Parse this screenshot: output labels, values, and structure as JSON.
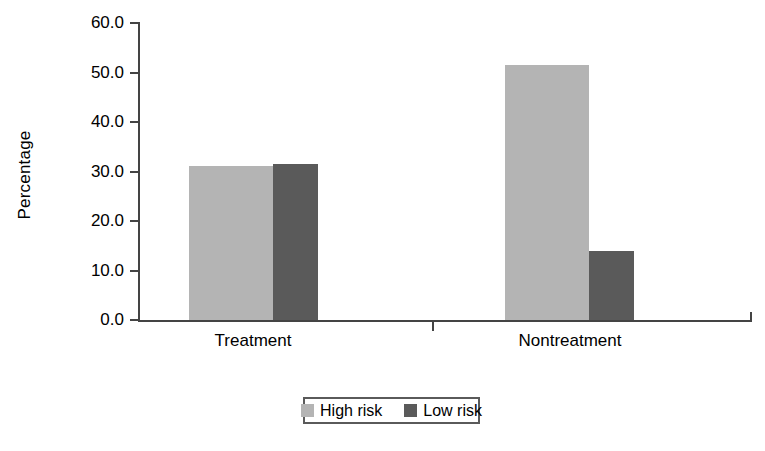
{
  "chart_data": {
    "type": "bar",
    "title": "",
    "xlabel": "",
    "ylabel": "Percentage",
    "categories": [
      "Treatment",
      "Nontreatment"
    ],
    "series": [
      {
        "name": "High risk",
        "color": "#b4b4b4",
        "values": [
          31.2,
          51.5
        ]
      },
      {
        "name": "Low risk",
        "color": "#5a5a5a",
        "values": [
          31.6,
          14.0
        ]
      }
    ],
    "ylim": [
      0,
      60
    ],
    "yticks": [
      0,
      10,
      20,
      30,
      40,
      50,
      60
    ],
    "ytick_labels": [
      "0.0",
      "10.0",
      "20.0",
      "30.0",
      "40.0",
      "50.0",
      "60.0"
    ],
    "grid": false,
    "legend_position": "bottom"
  },
  "axis": {
    "y_title": "Percentage",
    "y_labels": [
      "60.0",
      "50.0",
      "40.0",
      "30.0",
      "20.0",
      "10.0",
      "0.0"
    ],
    "x_labels": [
      "Treatment",
      "Nontreatment"
    ]
  },
  "legend": {
    "entries": [
      {
        "label": "High risk",
        "color": "#b4b4b4"
      },
      {
        "label": "Low risk",
        "color": "#5a5a5a"
      }
    ]
  },
  "colors": {
    "high_risk": "#b4b4b4",
    "low_risk": "#5a5a5a",
    "axis": "#444444",
    "background": "#ffffff"
  },
  "geometry": {
    "baseline_y": 320,
    "px_per_unit": 4.95,
    "bars": [
      {
        "x": 189,
        "width": 84,
        "series": 0,
        "category": 0
      },
      {
        "x": 273,
        "width": 45,
        "series": 1,
        "category": 0
      },
      {
        "x": 505,
        "width": 84,
        "series": 0,
        "category": 1
      },
      {
        "x": 589,
        "width": 45,
        "series": 1,
        "category": 1
      }
    ],
    "cat_label_centers": [
      253,
      570
    ]
  }
}
